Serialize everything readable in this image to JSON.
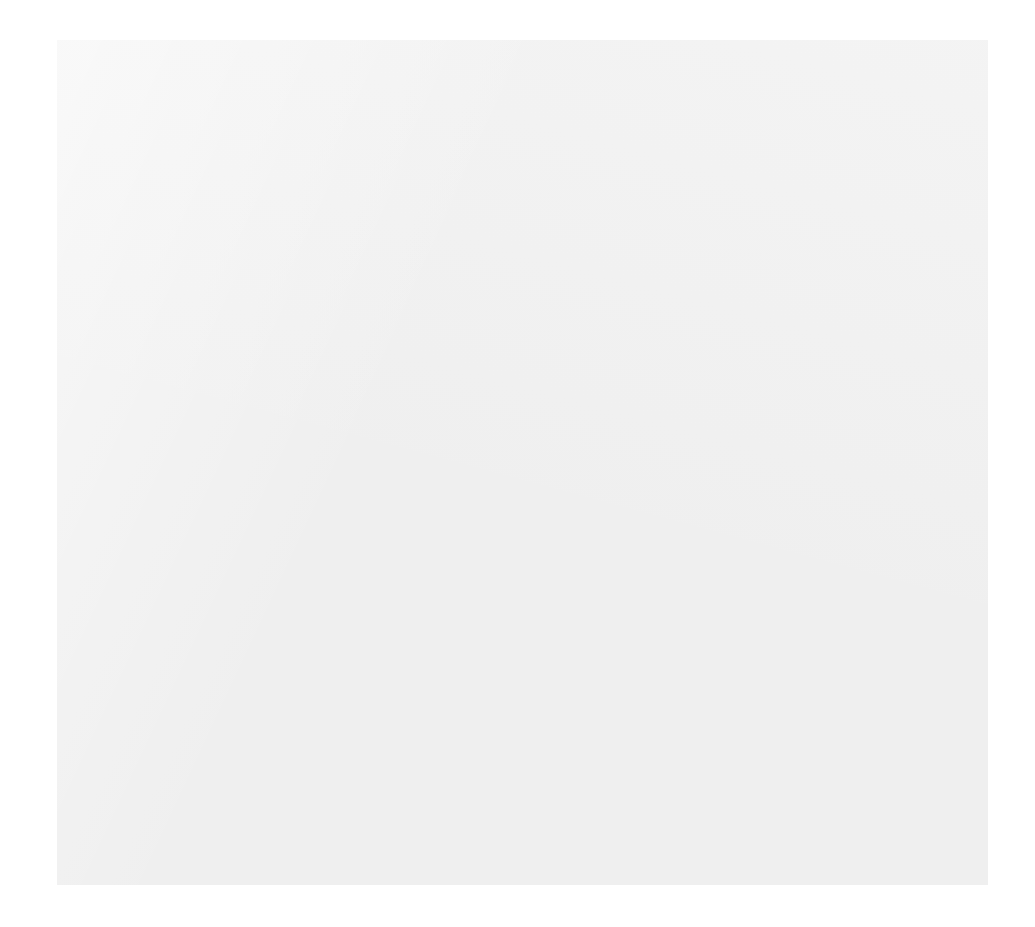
{
  "header": {
    "subtitle": "Exodus 6:14–25"
  },
  "colors": {
    "page_background": "#ffffff",
    "card_background": "#efefef",
    "node_fill": "#272727",
    "node_text": "#ffffff",
    "highlight_fill": "#a9a9a9",
    "connector": "#5a5a5a"
  },
  "chart_data": {
    "type": "diagram",
    "subtitle": "Exodus 6:14–25",
    "nodes": [
      {
        "id": "levi",
        "label": "Levi",
        "generation": 1,
        "x": 513,
        "y": 214,
        "w": 118,
        "h": 56,
        "highlight": false
      },
      {
        "id": "gershon",
        "label": "Gershon",
        "generation": 2,
        "x": 330,
        "y": 334,
        "w": 130,
        "h": 56,
        "highlight": false
      },
      {
        "id": "kohath",
        "label": "Kohath",
        "generation": 2,
        "x": 513,
        "y": 334,
        "w": 124,
        "h": 56,
        "highlight": false
      },
      {
        "id": "merari",
        "label": "Merari",
        "generation": 2,
        "x": 711,
        "y": 334,
        "w": 116,
        "h": 56,
        "highlight": false
      },
      {
        "id": "jochebed",
        "label": "Jochebed",
        "generation": 3,
        "x": 271,
        "y": 453,
        "w": 128,
        "h": 56,
        "highlight": false
      },
      {
        "id": "amram",
        "label": "Amram",
        "generation": 3,
        "x": 440,
        "y": 453,
        "w": 120,
        "h": 56,
        "highlight": false
      },
      {
        "id": "hebron",
        "label": "Hebron",
        "generation": 3,
        "x": 571,
        "y": 453,
        "w": 122,
        "h": 56,
        "highlight": false
      },
      {
        "id": "izhar",
        "label": "Izhar",
        "generation": 3,
        "x": 691,
        "y": 453,
        "w": 106,
        "h": 56,
        "highlight": false
      },
      {
        "id": "uzziel",
        "label": "Uzziel",
        "generation": 3,
        "x": 837,
        "y": 453,
        "w": 116,
        "h": 56,
        "highlight": false
      },
      {
        "id": "elisheba",
        "label": "Elisheba",
        "generation": 4,
        "x": 189,
        "y": 572,
        "w": 124,
        "h": 56,
        "highlight": false
      },
      {
        "id": "aaron",
        "label": "Aaron",
        "generation": 4,
        "x": 355,
        "y": 572,
        "w": 118,
        "h": 56,
        "highlight": false
      },
      {
        "id": "miriam",
        "label": "Miriam",
        "generation": 4,
        "x": 544,
        "y": 572,
        "w": 124,
        "h": 56,
        "highlight": false
      },
      {
        "id": "zipporah",
        "label": "Zipporah",
        "generation": 4,
        "x": 736,
        "y": 572,
        "w": 124,
        "h": 56,
        "highlight": false
      },
      {
        "id": "moses",
        "label": "MOSES",
        "generation": 4,
        "x": 908,
        "y": 572,
        "w": 116,
        "h": 56,
        "highlight": true
      },
      {
        "id": "nadab",
        "label": "Nadab",
        "generation": 5,
        "x": 142,
        "y": 689,
        "w": 122,
        "h": 56,
        "highlight": false
      },
      {
        "id": "abihu",
        "label": "Abihu",
        "generation": 5,
        "x": 272,
        "y": 689,
        "w": 118,
        "h": 56,
        "highlight": false
      },
      {
        "id": "eleazar",
        "label": "Eleazar",
        "generation": 5,
        "x": 403,
        "y": 689,
        "w": 128,
        "h": 56,
        "highlight": false
      },
      {
        "id": "ithamar",
        "label": "Ithamar",
        "generation": 5,
        "x": 538,
        "y": 689,
        "w": 126,
        "h": 56,
        "highlight": false
      },
      {
        "id": "gershom",
        "label": "Gershom",
        "generation": 5,
        "x": 750,
        "y": 689,
        "w": 128,
        "h": 56,
        "highlight": false
      },
      {
        "id": "eliezer",
        "label": "Eliezer",
        "generation": 5,
        "x": 880,
        "y": 689,
        "w": 116,
        "h": 56,
        "highlight": false
      },
      {
        "id": "phinehas",
        "label": "Phinehas",
        "generation": 6,
        "x": 403,
        "y": 810,
        "w": 132,
        "h": 56,
        "highlight": false
      }
    ],
    "marriages": [
      {
        "id": "jochebed-amram",
        "left": "jochebed",
        "right": "amram",
        "x1": 335,
        "x2": 380,
        "y": 453,
        "drop_x": 355
      },
      {
        "id": "elisheba-aaron",
        "left": "elisheba",
        "right": "aaron",
        "x1": 251,
        "x2": 296,
        "y": 572,
        "drop_x": 272
      },
      {
        "id": "zipporah-moses",
        "left": "zipporah",
        "right": "moses",
        "x1": 798,
        "x2": 850,
        "y": 572,
        "drop_x": 823
      }
    ],
    "parent_child_links": [
      {
        "parent": "levi",
        "children": [
          "gershon",
          "kohath",
          "merari"
        ]
      },
      {
        "parent": "kohath",
        "children": [
          "amram",
          "hebron",
          "izhar",
          "uzziel"
        ]
      },
      {
        "parent": "jochebed-amram",
        "children": [
          "aaron",
          "miriam",
          "moses"
        ]
      },
      {
        "parent": "elisheba-aaron",
        "children": [
          "nadab",
          "abihu",
          "eleazar",
          "ithamar"
        ]
      },
      {
        "parent": "zipporah-moses",
        "children": [
          "gershom",
          "eliezer"
        ]
      },
      {
        "parent": "eleazar",
        "children": [
          "phinehas"
        ]
      }
    ]
  }
}
